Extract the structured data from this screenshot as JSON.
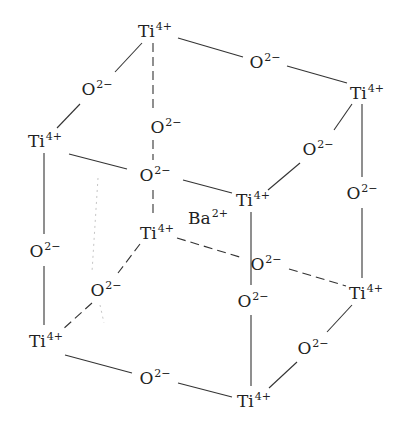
{
  "diagram": {
    "title": "",
    "line_color": "#333333",
    "ions": {
      "ti": {
        "symbol": "Ti",
        "charge": "4+"
      },
      "o": {
        "symbol": "O",
        "charge": "2−"
      },
      "ba": {
        "symbol": "Ba",
        "charge": "2+"
      }
    },
    "labels": [
      {
        "id": "ti-top-back-left",
        "symbol": "Ti",
        "charge": "4+",
        "x": 155,
        "y": 30
      },
      {
        "id": "o-top-left-edge",
        "symbol": "O",
        "charge": "2−",
        "x": 97,
        "y": 88
      },
      {
        "id": "o-top-back-edge",
        "symbol": "O",
        "charge": "2−",
        "x": 265,
        "y": 61
      },
      {
        "id": "ti-top-back-right",
        "symbol": "Ti",
        "charge": "4+",
        "x": 367,
        "y": 92
      },
      {
        "id": "ti-top-front-left",
        "symbol": "Ti",
        "charge": "4+",
        "x": 45,
        "y": 140
      },
      {
        "id": "o-back-left-vertical",
        "symbol": "O",
        "charge": "2−",
        "x": 166,
        "y": 126
      },
      {
        "id": "o-top-front-edge",
        "symbol": "O",
        "charge": "2−",
        "x": 155,
        "y": 174
      },
      {
        "id": "o-top-right-edge",
        "symbol": "O",
        "charge": "2−",
        "x": 318,
        "y": 148
      },
      {
        "id": "ti-top-front-right",
        "symbol": "Ti",
        "charge": "4+",
        "x": 253,
        "y": 199
      },
      {
        "id": "o-back-right-vertical",
        "symbol": "O",
        "charge": "2−",
        "x": 362,
        "y": 192
      },
      {
        "id": "ba-center",
        "symbol": "Ba",
        "charge": "2+",
        "x": 208,
        "y": 217
      },
      {
        "id": "ti-bottom-back-left",
        "symbol": "Ti",
        "charge": "4+",
        "x": 157,
        "y": 232
      },
      {
        "id": "o-front-left-vertical",
        "symbol": "O",
        "charge": "2−",
        "x": 45,
        "y": 250
      },
      {
        "id": "o-bottom-back-edge",
        "symbol": "O",
        "charge": "2−",
        "x": 266,
        "y": 263
      },
      {
        "id": "o-front-right-vertical",
        "symbol": "O",
        "charge": "2−",
        "x": 253,
        "y": 300
      },
      {
        "id": "ti-bottom-back-right",
        "symbol": "Ti",
        "charge": "4+",
        "x": 366,
        "y": 292
      },
      {
        "id": "o-bottom-left-edge",
        "symbol": "O",
        "charge": "2−",
        "x": 106,
        "y": 289
      },
      {
        "id": "ti-bottom-front-left",
        "symbol": "Ti",
        "charge": "4+",
        "x": 46,
        "y": 340
      },
      {
        "id": "o-bottom-right-edge",
        "symbol": "O",
        "charge": "2−",
        "x": 313,
        "y": 347
      },
      {
        "id": "o-bottom-front-edge",
        "symbol": "O",
        "charge": "2−",
        "x": 155,
        "y": 377
      },
      {
        "id": "ti-bottom-front-right",
        "symbol": "Ti",
        "charge": "4+",
        "x": 254,
        "y": 400
      }
    ],
    "solid_lines": [
      [
        142,
        43,
        115,
        72
      ],
      [
        80,
        104,
        57,
        128
      ],
      [
        178,
        38,
        243,
        57
      ],
      [
        287,
        66,
        347,
        83
      ],
      [
        69,
        154,
        127,
        169
      ],
      [
        183,
        180,
        232,
        193
      ],
      [
        352,
        104,
        334,
        130
      ],
      [
        300,
        163,
        268,
        190
      ],
      [
        362,
        104,
        362,
        177
      ],
      [
        362,
        208,
        362,
        278
      ],
      [
        44,
        153,
        44,
        234
      ],
      [
        44,
        266,
        44,
        325
      ],
      [
        251,
        212,
        251,
        285
      ],
      [
        251,
        315,
        251,
        386
      ],
      [
        65,
        355,
        132,
        373
      ],
      [
        178,
        383,
        232,
        397
      ],
      [
        352,
        305,
        327,
        332
      ],
      [
        297,
        362,
        269,
        388
      ]
    ],
    "dashed_lines": [
      [
        153,
        43,
        153,
        110
      ],
      [
        153,
        140,
        153,
        160
      ],
      [
        153,
        190,
        153,
        218
      ],
      [
        177,
        238,
        243,
        258
      ],
      [
        289,
        269,
        346,
        286
      ],
      [
        140,
        244,
        118,
        273
      ],
      [
        92,
        303,
        62,
        330
      ]
    ],
    "faint_dotted_lines": [
      [
        98,
        178,
        92,
        272
      ],
      [
        100,
        305,
        104,
        323
      ]
    ]
  }
}
